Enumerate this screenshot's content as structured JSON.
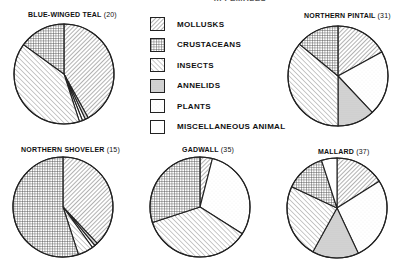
{
  "title": "... FEMALES",
  "legend": [
    {
      "key": "mollusks",
      "label": "MOLLUSKS"
    },
    {
      "key": "crustaceans",
      "label": "CRUSTACEANS"
    },
    {
      "key": "insects",
      "label": "INSECTS"
    },
    {
      "key": "annelids",
      "label": "ANNELIDS"
    },
    {
      "key": "plants",
      "label": "PLANTS"
    },
    {
      "key": "misc",
      "label": "MISCELLANEOUS ANIMAL"
    }
  ],
  "chart_data": [
    {
      "type": "pie",
      "title": "BLUE-WINGED TEAL",
      "n": "(20)",
      "categories": [
        "Mollusks",
        "Annelids",
        "Plants",
        "Miscellaneous Animal",
        "Insects",
        "Crustaceans"
      ],
      "values": [
        42,
        1,
        1,
        1,
        40,
        15
      ],
      "keys": [
        "mollusks",
        "annelids",
        "plants",
        "misc",
        "insects",
        "crustaceans"
      ]
    },
    {
      "type": "pie",
      "title": "NORTHERN PINTAIL",
      "n": "(31)",
      "categories": [
        "Mollusks",
        "Plants",
        "Annelids",
        "Insects",
        "Crustaceans"
      ],
      "values": [
        17,
        21,
        12,
        36,
        14
      ],
      "keys": [
        "mollusks",
        "plants",
        "annelids",
        "insects",
        "crustaceans"
      ]
    },
    {
      "type": "pie",
      "title": "NORTHERN SHOVELER",
      "n": "(15)",
      "categories": [
        "Mollusks",
        "Annelids",
        "Miscellaneous Animal",
        "Insects",
        "Crustaceans"
      ],
      "values": [
        38,
        1,
        1,
        5,
        55
      ],
      "keys": [
        "mollusks",
        "annelids",
        "misc",
        "insects",
        "crustaceans"
      ]
    },
    {
      "type": "pie",
      "title": "GADWALL",
      "n": "(35)",
      "categories": [
        "Mollusks",
        "Plants",
        "Insects",
        "Crustaceans"
      ],
      "values": [
        4,
        30,
        36,
        30
      ],
      "keys": [
        "mollusks",
        "plants",
        "insects",
        "crustaceans"
      ]
    },
    {
      "type": "pie",
      "title": "MALLARD",
      "n": "(37)",
      "categories": [
        "Mollusks",
        "Plants",
        "Annelids",
        "Insects",
        "Crustaceans",
        "Miscellaneous Animal"
      ],
      "values": [
        16,
        27,
        15,
        24,
        13,
        5
      ],
      "keys": [
        "mollusks",
        "plants",
        "annelids",
        "insects",
        "crustaceans",
        "misc"
      ]
    }
  ]
}
